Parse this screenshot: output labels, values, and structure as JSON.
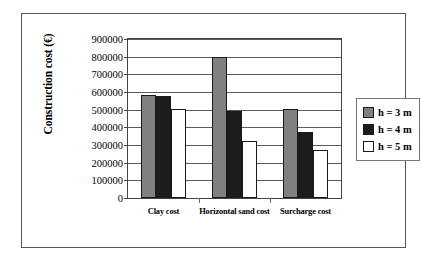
{
  "chart_data": {
    "type": "bar",
    "title": "",
    "xlabel": "",
    "ylabel": "Construction cost (€)",
    "categories": [
      "Clay cost",
      "Horizontal sand cost",
      "Surcharge cost"
    ],
    "series": [
      {
        "name": "h = 3 m",
        "color": "#808080",
        "values": [
          585000,
          800000,
          505000
        ]
      },
      {
        "name": "h = 4 m",
        "color": "#1c1c1c",
        "values": [
          575000,
          492000,
          375000
        ]
      },
      {
        "name": "h = 5 m",
        "color": "#ffffff",
        "values": [
          505000,
          323000,
          272000
        ]
      }
    ],
    "ylim": [
      0,
      900000
    ],
    "ytick_step": 100000,
    "ytick_labels": [
      "0",
      "100000",
      "200000",
      "300000",
      "400000",
      "500000",
      "600000",
      "700000",
      "800000",
      "900000"
    ],
    "grid": true,
    "legend_position": "right"
  }
}
